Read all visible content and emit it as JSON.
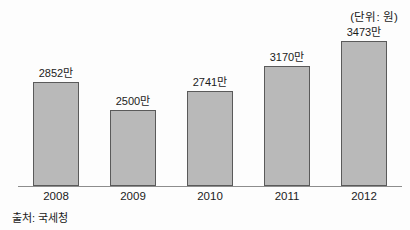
{
  "unit_annotation": "(단위: 원)",
  "source_note": "출처: 국세청",
  "chart_data": {
    "type": "bar",
    "title": "",
    "subtitle": "",
    "xlabel": "",
    "ylabel": "",
    "unit_annotation": "(단위: 원)",
    "source": "출처: 국세청",
    "grid": false,
    "legend": false,
    "axis_baseline_suppressed": true,
    "categories": [
      "2008",
      "2009",
      "2010",
      "2011",
      "2012"
    ],
    "values": [
      2852,
      2500,
      2741,
      3170,
      3473
    ],
    "value_labels": [
      "2852만",
      "2500만",
      "2741만",
      "3170만",
      "3473만"
    ],
    "value_unit": "만원",
    "ylim": [
      2250,
      3600
    ],
    "bars": [
      {
        "category": "2008",
        "value": 2852,
        "label": "2852만",
        "height_px": 104
      },
      {
        "category": "2009",
        "value": 2500,
        "label": "2500만",
        "height_px": 76
      },
      {
        "category": "2010",
        "value": 2741,
        "label": "2741만",
        "height_px": 95
      },
      {
        "category": "2011",
        "value": 3170,
        "label": "3170만",
        "height_px": 120
      },
      {
        "category": "2012",
        "value": 3473,
        "label": "3473만",
        "height_px": 145
      }
    ],
    "colors": {
      "bar_fill": "#b9b9b9",
      "bar_border": "#5a5a5a",
      "axis": "#8d8d8d",
      "text": "#1b1b1b",
      "background": "#fdfdfd"
    }
  }
}
